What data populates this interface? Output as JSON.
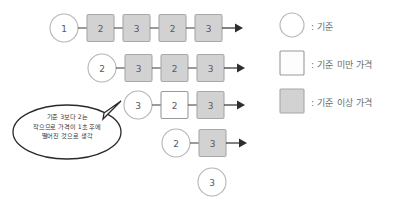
{
  "diagram": {
    "colors": {
      "above_fill": "#d2d2d2",
      "above_stroke": "#a8a8a8",
      "below_fill": "#ffffff",
      "below_stroke": "#9a9a9a",
      "circle_stroke": "#b4b4b4",
      "arrow": "#2e2e2e",
      "bubble_stroke": "#2a2a2a",
      "text": "#5a5a5a"
    },
    "rows": [
      {
        "circle": "1",
        "boxes": [
          {
            "value": "2",
            "type": "above"
          },
          {
            "value": "3",
            "type": "above"
          },
          {
            "value": "2",
            "type": "above"
          },
          {
            "value": "3",
            "type": "above"
          }
        ],
        "arrow": true
      },
      {
        "circle": "2",
        "boxes": [
          {
            "value": "3",
            "type": "above"
          },
          {
            "value": "2",
            "type": "above"
          },
          {
            "value": "3",
            "type": "above"
          }
        ],
        "arrow": true
      },
      {
        "circle": "3",
        "boxes": [
          {
            "value": "2",
            "type": "below"
          },
          {
            "value": "3",
            "type": "above"
          }
        ],
        "arrow": true
      },
      {
        "circle": "2",
        "boxes": [
          {
            "value": "3",
            "type": "above"
          }
        ],
        "arrow": true
      },
      {
        "circle": "3",
        "boxes": [],
        "arrow": false
      }
    ]
  },
  "bubble": {
    "lines": [
      "기준 3보다 2는",
      "작으므로 가격이 1초 후에",
      "떨어진 것으로 생각"
    ]
  },
  "legend": {
    "items": [
      {
        "shape": "circle",
        "label": ": 기준"
      },
      {
        "shape": "square-below",
        "label": ": 기준 미만 가격"
      },
      {
        "shape": "square-above",
        "label": ": 기준 이상 가격"
      }
    ]
  }
}
